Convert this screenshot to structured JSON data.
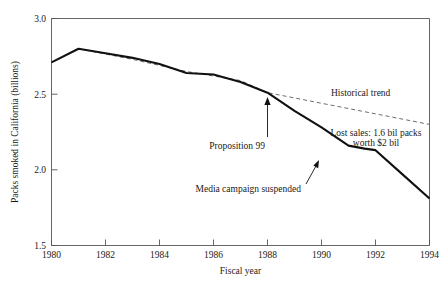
{
  "chart_data": {
    "type": "line",
    "title": "",
    "xlabel": "Fiscal year",
    "ylabel": "Packs smoked in California (billions)",
    "xlim": [
      1980,
      1994
    ],
    "ylim": [
      1.5,
      3.0
    ],
    "xticks": [
      1980,
      1982,
      1984,
      1986,
      1988,
      1990,
      1992,
      1994
    ],
    "xtick_labels": [
      "1980",
      "1982",
      "1984",
      "1986",
      "1988",
      "1990",
      "1992",
      "1994"
    ],
    "yticks": [
      1.5,
      2.0,
      2.5,
      3.0
    ],
    "ytick_labels": [
      "1.5",
      "2.0",
      "2.5",
      "3.0"
    ],
    "grid": false,
    "legend_position": "inline-annotation",
    "series": [
      {
        "name": "Actual packs smoked",
        "style": "solid",
        "color": "#111111",
        "x": [
          1980,
          1981,
          1982,
          1983,
          1984,
          1985,
          1986,
          1987,
          1988,
          1989,
          1990,
          1991,
          1991.6,
          1992,
          1993,
          1994
        ],
        "values": [
          2.71,
          2.8,
          2.77,
          2.74,
          2.7,
          2.64,
          2.63,
          2.58,
          2.51,
          2.39,
          2.28,
          2.16,
          2.14,
          2.13,
          1.97,
          1.81
        ]
      },
      {
        "name": "Historical trend",
        "style": "dashed",
        "color": "#6d6d6d",
        "x": [
          1981,
          1983,
          1985,
          1987,
          1988,
          1990,
          1992,
          1994
        ],
        "values": [
          2.8,
          2.73,
          2.65,
          2.59,
          2.51,
          2.44,
          2.37,
          2.3
        ]
      }
    ],
    "annotations": [
      {
        "name": "historical-trend-label",
        "text": "Historical trend",
        "x": 1990.6,
        "y": 2.57
      },
      {
        "name": "proposition-99-label",
        "text": "Proposition 99",
        "x": 1986.6,
        "y": 2.21,
        "points_to": {
          "x": 1988,
          "y": 2.51
        }
      },
      {
        "name": "lost-sales-label",
        "line1": "Lost sales: 1.6 bil packs",
        "line2": "worth $2 bil",
        "x": 1991.4,
        "y": 2.3
      },
      {
        "name": "media-campaign-label",
        "text": "Media campaign suspended",
        "x": 1988.4,
        "y": 1.98,
        "points_to": {
          "x": 1991.6,
          "y": 2.14
        }
      }
    ]
  },
  "axes": {
    "y_title": "Packs smoked in California (billions)",
    "x_title": "Fiscal year",
    "y_tick_0": "1.5",
    "y_tick_1": "2.0",
    "y_tick_2": "2.5",
    "y_tick_3": "3.0",
    "x_tick_0": "1980",
    "x_tick_1": "1982",
    "x_tick_2": "1984",
    "x_tick_3": "1986",
    "x_tick_4": "1988",
    "x_tick_5": "1990",
    "x_tick_6": "1992",
    "x_tick_7": "1994"
  },
  "annotations": {
    "historical_trend": "Historical trend",
    "proposition_99": "Proposition 99",
    "lost_sales_line1": "Lost sales: 1.6 bil packs",
    "lost_sales_line2": "worth $2 bil",
    "media_campaign": "Media campaign suspended"
  },
  "colors": {
    "series_solid": "#111111",
    "series_dashed": "#6d6d6d",
    "frame": "#555555",
    "text": "#1a1a1a",
    "background": "#ffffff"
  }
}
